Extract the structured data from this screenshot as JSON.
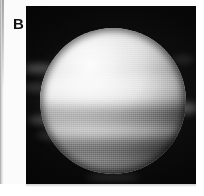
{
  "figure": {
    "panel_label": "B",
    "caption": "",
    "background_color": "#ffffff",
    "plate_color": "#050505"
  },
  "chart_data": {
    "type": "heatmap",
    "title": "",
    "subtitle": "",
    "xlabel": "",
    "ylabel": "",
    "annotations": [
      "B"
    ],
    "legend": [],
    "grid": false,
    "image_mode": "grayscale",
    "value_range": [
      0,
      255
    ],
    "disk": {
      "center_x_px": 112,
      "center_y_px": 100,
      "diameter_px": 146,
      "brightest_point_x_px": 84,
      "brightest_point_y_px": 60,
      "peak_brightness": 253,
      "limb_brightness": 40,
      "illumination_direction": "upper-left"
    },
    "bands": [
      {
        "name": "north polar hood",
        "y_fraction": 0.08,
        "relative_brightness": 0.86
      },
      {
        "name": "north temperate zone",
        "y_fraction": 0.22,
        "relative_brightness": 0.93
      },
      {
        "name": "north equatorial belt",
        "y_fraction": 0.3,
        "relative_brightness": 0.72
      },
      {
        "name": "bright equatorial zone",
        "y_fraction": 0.4,
        "relative_brightness": 1.0
      },
      {
        "name": "south equatorial belt",
        "y_fraction": 0.56,
        "relative_brightness": 0.58
      },
      {
        "name": "south temperate zone",
        "y_fraction": 0.7,
        "relative_brightness": 0.74
      },
      {
        "name": "south temperate belt",
        "y_fraction": 0.82,
        "relative_brightness": 0.46
      },
      {
        "name": "south polar region",
        "y_fraction": 0.93,
        "relative_brightness": 0.34
      }
    ],
    "scan_profile_y": [
      0.05,
      0.15,
      0.25,
      0.35,
      0.45,
      0.55,
      0.65,
      0.75,
      0.85,
      0.95
    ],
    "scan_profile_values": [
      120,
      205,
      232,
      248,
      238,
      176,
      188,
      150,
      112,
      72
    ]
  }
}
